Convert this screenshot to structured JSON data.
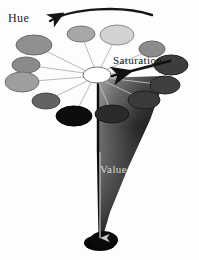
{
  "figure": {
    "background_color": "#fdfdfd"
  },
  "labels": {
    "hue": "Hue",
    "saturation": "Saturation",
    "value": "Value"
  },
  "center_hub": {
    "name": "white-center-ellipse",
    "fill": "#ffffff",
    "stroke": "#777777",
    "cx": 97,
    "cy": 75,
    "rx": 14,
    "ry": 8
  },
  "hue_arrow": {
    "name": "hue-arc-arrow",
    "direction": "counter-clockwise",
    "color": "#1a1a1a",
    "start": [
      150,
      14
    ],
    "end": [
      48,
      22
    ]
  },
  "saturation_arrow": {
    "name": "saturation-arrow",
    "direction": "inward-to-center",
    "color": "#111111",
    "start": [
      168,
      60
    ],
    "end": [
      110,
      76
    ]
  },
  "value_arrow": {
    "name": "value-down-arrow",
    "direction": "downward",
    "color": "#cccccc",
    "start": [
      100,
      150
    ],
    "end": [
      100,
      240
    ]
  },
  "cone": {
    "name": "value-gradient-cone",
    "apex": [
      100,
      246
    ],
    "top_left": [
      98,
      78
    ],
    "top_right": [
      166,
      76
    ],
    "gradient_from": "#8f8f8f",
    "gradient_to": "#050505"
  },
  "hue_ellipses": [
    {
      "id": "hue-0",
      "label": "hue-swatch-0",
      "cx": 34,
      "cy": 45,
      "rx": 18,
      "ry": 10,
      "fill": "#909090",
      "stroke": "#6a6a6a",
      "spoke_to": [
        86,
        71
      ]
    },
    {
      "id": "hue-1",
      "label": "hue-swatch-1",
      "cx": 26,
      "cy": 65,
      "rx": 14,
      "ry": 8,
      "fill": "#8a8a8a",
      "stroke": "#6a6a6a",
      "spoke_to": [
        84,
        73
      ]
    },
    {
      "id": "hue-2",
      "label": "hue-swatch-2",
      "cx": 22,
      "cy": 82,
      "rx": 17,
      "ry": 10,
      "fill": "#9e9e9e",
      "stroke": "#707070",
      "spoke_to": [
        84,
        77
      ]
    },
    {
      "id": "hue-3",
      "label": "hue-swatch-3",
      "cx": 46,
      "cy": 101,
      "rx": 14,
      "ry": 8,
      "fill": "#636363",
      "stroke": "#4a4a4a",
      "spoke_to": [
        87,
        81
      ]
    },
    {
      "id": "hue-4",
      "label": "hue-swatch-4",
      "cx": 74,
      "cy": 116,
      "rx": 18,
      "ry": 10,
      "fill": "#0d0d0d",
      "stroke": "#000000",
      "spoke_to": [
        91,
        83
      ]
    },
    {
      "id": "hue-5",
      "label": "hue-swatch-5",
      "cx": 112,
      "cy": 114,
      "rx": 17,
      "ry": 9,
      "fill": "#2b2b2b",
      "stroke": "#151515",
      "spoke_to": [
        99,
        83
      ]
    },
    {
      "id": "hue-6",
      "label": "hue-swatch-6",
      "cx": 144,
      "cy": 100,
      "rx": 16,
      "ry": 9,
      "fill": "#3a3a3a",
      "stroke": "#1f1f1f",
      "spoke_to": [
        104,
        81
      ]
    },
    {
      "id": "hue-7",
      "label": "hue-swatch-7",
      "cx": 165,
      "cy": 85,
      "rx": 15,
      "ry": 9,
      "fill": "#3f3f3f",
      "stroke": "#222222",
      "spoke_to": [
        107,
        78
      ]
    },
    {
      "id": "hue-8",
      "label": "hue-swatch-8",
      "cx": 171,
      "cy": 65,
      "rx": 17,
      "ry": 10,
      "fill": "#3d3d3d",
      "stroke": "#202020",
      "spoke_to": [
        108,
        74
      ]
    },
    {
      "id": "hue-9",
      "label": "hue-swatch-9",
      "cx": 152,
      "cy": 49,
      "rx": 13,
      "ry": 8,
      "fill": "#8c8c8c",
      "stroke": "#666666",
      "spoke_to": [
        106,
        70
      ]
    },
    {
      "id": "hue-10",
      "label": "hue-swatch-10",
      "cx": 117,
      "cy": 35,
      "rx": 17,
      "ry": 10,
      "fill": "#d2d2d2",
      "stroke": "#8c8c8c",
      "spoke_to": [
        101,
        67
      ]
    },
    {
      "id": "hue-11",
      "label": "hue-swatch-11",
      "cx": 81,
      "cy": 34,
      "rx": 14,
      "ry": 8,
      "fill": "#a7a7a7",
      "stroke": "#777777",
      "spoke_to": [
        94,
        67
      ]
    }
  ]
}
